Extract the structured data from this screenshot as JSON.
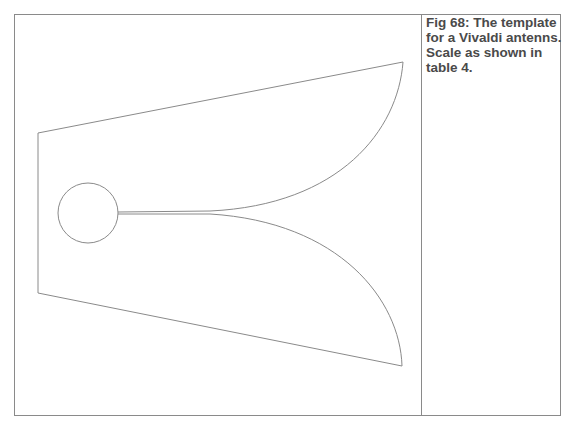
{
  "figure": {
    "caption_lines": [
      "Fig 68: The template",
      "for a Vivaldi antenns.",
      "Scale as shown in",
      "table 4."
    ]
  },
  "drawing": {
    "subject": "Vivaldi antenna template outline",
    "stroke_color": "#8a8a8a",
    "frame_color": "#8a8a8a",
    "outline_points": {
      "top_left": [
        38,
        133
      ],
      "top_right_tip": [
        403,
        62
      ],
      "bottom_right_tip": [
        402,
        366
      ],
      "bottom_left": [
        38,
        293
      ]
    },
    "feed_circle": {
      "cx": 88,
      "cy": 213,
      "r": 30
    }
  }
}
